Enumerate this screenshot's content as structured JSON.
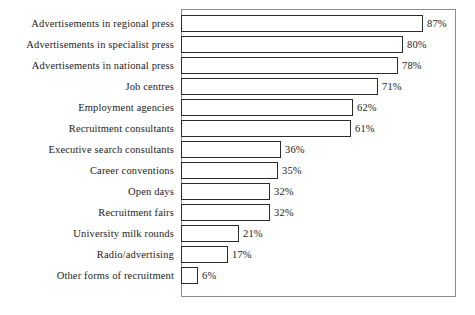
{
  "chart": {
    "type": "bar",
    "orientation": "horizontal",
    "frame_color": "#8c8c8c",
    "bar_outline_color": "#2b2b2b",
    "bar_fill_color": "#ffffff",
    "background": "#ffffff"
  },
  "chart_data": {
    "type": "bar",
    "title": "",
    "subtitle": "",
    "xlabel": "",
    "ylabel": "",
    "xlim": [
      0,
      100
    ],
    "grid": false,
    "legend": false,
    "orientation": "horizontal",
    "value_suffix": "%",
    "categories": [
      "Advertisements in regional press",
      "Advertisements in specialist press",
      "Advertisements in national press",
      "Job centres",
      "Employment agencies",
      "Recruitment consultants",
      "Executive search consultants",
      "Career conventions",
      "Open days",
      "Recruitment fairs",
      "University milk rounds",
      "Radio/advertising",
      "Other forms of recruitment"
    ],
    "values": [
      87,
      80,
      78,
      71,
      62,
      61,
      36,
      35,
      32,
      32,
      21,
      17,
      6
    ],
    "value_labels": [
      "87%",
      "80%",
      "78%",
      "71%",
      "62%",
      "61%",
      "36%",
      "35%",
      "32%",
      "32%",
      "21%",
      "17%",
      "6%"
    ]
  },
  "rows": [
    {
      "label": "Advertisements in regional press",
      "value": 87,
      "value_label": "87%"
    },
    {
      "label": "Advertisements in specialist press",
      "value": 80,
      "value_label": "80%"
    },
    {
      "label": "Advertisements in national press",
      "value": 78,
      "value_label": "78%"
    },
    {
      "label": "Job centres",
      "value": 71,
      "value_label": "71%"
    },
    {
      "label": "Employment agencies",
      "value": 62,
      "value_label": "62%"
    },
    {
      "label": "Recruitment consultants",
      "value": 61,
      "value_label": "61%"
    },
    {
      "label": "Executive search consultants",
      "value": 36,
      "value_label": "36%"
    },
    {
      "label": "Career conventions",
      "value": 35,
      "value_label": "35%"
    },
    {
      "label": "Open days",
      "value": 32,
      "value_label": "32%"
    },
    {
      "label": "Recruitment fairs",
      "value": 32,
      "value_label": "32%"
    },
    {
      "label": "University milk rounds",
      "value": 21,
      "value_label": "21%"
    },
    {
      "label": "Radio/advertising",
      "value": 17,
      "value_label": "17%"
    },
    {
      "label": "Other forms of recruitment",
      "value": 6,
      "value_label": "6%"
    }
  ]
}
